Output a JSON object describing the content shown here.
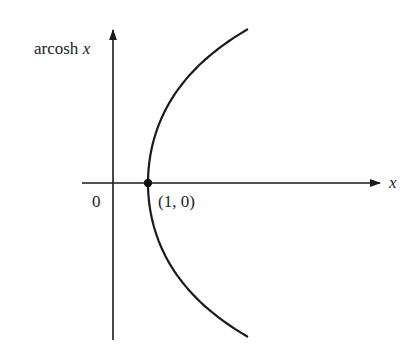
{
  "figure": {
    "y_axis_label_text": "arcosh",
    "y_axis_label_var": "x",
    "x_axis_label": "x",
    "origin_label": "0",
    "point_label": "(1, 0)"
  },
  "chart_data": {
    "type": "line",
    "title": "",
    "xlabel": "x",
    "ylabel": "arcosh x",
    "series": [
      {
        "name": "arcosh x (upper branch, y = +arcosh x)",
        "x": [
          1,
          1.05,
          1.2,
          1.5,
          2.0,
          2.5,
          3.0,
          3.5,
          3.83
        ],
        "values": [
          0,
          0.32,
          0.62,
          0.96,
          1.32,
          1.57,
          1.76,
          1.92,
          2.02
        ]
      },
      {
        "name": "lower branch (y = -arcosh x)",
        "x": [
          1,
          1.05,
          1.2,
          1.5,
          2.0,
          2.5,
          3.0,
          3.5,
          3.83
        ],
        "values": [
          0,
          -0.32,
          -0.62,
          -0.96,
          -1.32,
          -1.57,
          -1.76,
          -1.92,
          -2.02
        ]
      }
    ],
    "annotations": [
      {
        "point": [
          1,
          0
        ],
        "label": "(1, 0)",
        "marker": "filled-dot"
      },
      {
        "point": [
          0,
          0
        ],
        "label": "0"
      }
    ],
    "grid": false,
    "legend": "none",
    "colors": {
      "curve": "#1a1a1a",
      "axes": "#1a1a1a",
      "background": "#ffffff"
    }
  }
}
